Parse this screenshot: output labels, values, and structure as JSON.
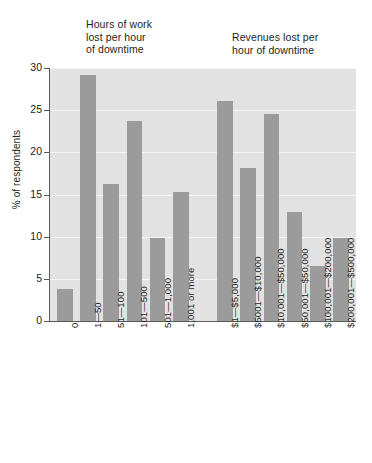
{
  "chart_data": {
    "type": "bar",
    "title": "",
    "xlabel": "",
    "ylabel": "% of respondents",
    "ylim": [
      0,
      30
    ],
    "yticks": [
      0,
      5,
      10,
      15,
      20,
      25,
      30
    ],
    "grid": true,
    "legend": "none",
    "group_titles": [
      "Hours of work\nlost per hour\nof downtime",
      "Revenues lost per\nhour of downtime"
    ],
    "categories": [
      "0",
      "1—50",
      "51—100",
      "101—500",
      "501—1,000",
      "1,001 or more",
      "$1—$5,000",
      "$5001—$10,000",
      "$10,001—$50,000",
      "$50,001—$50,000",
      "$100,001—$200,000",
      "$200,001—$500,000"
    ],
    "values": [
      3.8,
      29.2,
      16.2,
      23.7,
      9.9,
      15.3,
      26.1,
      18.2,
      24.6,
      12.9,
      6.5,
      9.8
    ],
    "groups": [
      {
        "name": "Hours of work lost per hour of downtime",
        "categories": [
          "0",
          "1—50",
          "51—100",
          "101—500",
          "501—1,000",
          "1,001 or more"
        ],
        "values": [
          3.8,
          29.2,
          16.2,
          23.7,
          9.9,
          15.3
        ]
      },
      {
        "name": "Revenues lost per hour of downtime",
        "categories": [
          "$1—$5,000",
          "$5001—$10,000",
          "$10,001—$50,000",
          "$50,001—$50,000",
          "$100,001—$200,000",
          "$200,001—$500,000"
        ],
        "values": [
          26.1,
          18.2,
          24.6,
          12.9,
          6.5,
          9.8
        ]
      }
    ],
    "colors": {
      "bar": "#9b9b9b",
      "plot_background": "#e2e2e2",
      "gridline": "#f4f4f4",
      "axis": "#5a5a5a",
      "text": "#231f20",
      "page_background": "#ffffff"
    }
  }
}
